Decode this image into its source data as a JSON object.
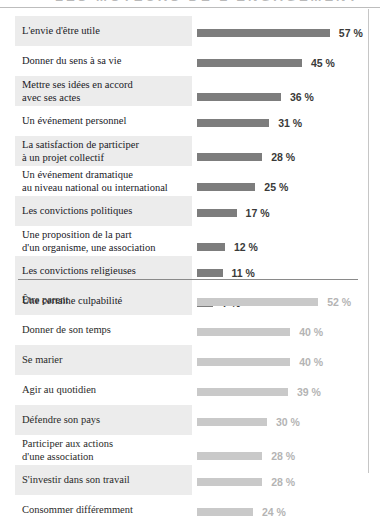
{
  "top_strip": {
    "clipped_title_remnant": "LES MOTEURS DE L'ENGAGEMENT"
  },
  "units": {
    "percent_suffix": "%"
  },
  "colors": {
    "bar_section_1": "#7d7d7d",
    "bar_section_2": "#c9c9c9",
    "row_band": "#ececec",
    "value_section_1": "#3a3a39",
    "value_section_2": "#b4b4b4",
    "label_text": "#20201f",
    "rule": "#8a8a8a"
  },
  "chart_data": [
    {
      "type": "bar",
      "title": "",
      "xlabel": "",
      "ylabel": "",
      "orientation": "horizontal",
      "grid": false,
      "legend": "none",
      "xlim": [
        0,
        60
      ],
      "categories": [
        "L'envie d'être utile",
        "Donner du sens à sa vie",
        "Mettre ses idées en accord\navec ses actes",
        "Un événement personnel",
        "La satisfaction de participer\nà un projet collectif",
        "Un événement dramatique\nau niveau national ou international",
        "Les convictions politiques",
        "Une proposition de la part\nd'un organisme, une association",
        "Les convictions religieuses",
        "Une certaine culpabilité"
      ],
      "values": [
        57,
        45,
        36,
        31,
        28,
        25,
        17,
        12,
        11,
        7
      ],
      "value_labels": [
        "57 %",
        "45 %",
        "36 %",
        "31 %",
        "28 %",
        "25 %",
        "17 %",
        "12 %",
        "11 %",
        "7 %"
      ]
    },
    {
      "type": "bar",
      "title": "",
      "xlabel": "",
      "ylabel": "",
      "orientation": "horizontal",
      "grid": false,
      "legend": "none",
      "xlim": [
        0,
        60
      ],
      "categories": [
        "Être parent",
        "Donner de son temps",
        "Se marier",
        "Agir au quotidien",
        "Défendre son pays",
        "Participer aux actions\nd'une association",
        "S'investir dans son travail",
        "Consommer différemment"
      ],
      "values": [
        52,
        40,
        40,
        39,
        30,
        28,
        28,
        24
      ],
      "value_labels": [
        "52 %",
        "40 %",
        "40 %",
        "39 %",
        "30 %",
        "28 %",
        "28 %",
        "24 %"
      ]
    }
  ],
  "section_1": {
    "rows": [
      {
        "label_line1": "L'envie d'être utile",
        "label_line2": "",
        "value": "57 %",
        "pct": 57,
        "shaded": true
      },
      {
        "label_line1": "Donner du sens à sa vie",
        "label_line2": "",
        "value": "45 %",
        "pct": 45,
        "shaded": false
      },
      {
        "label_line1": "Mettre ses idées en accord",
        "label_line2": "avec ses actes",
        "value": "36 %",
        "pct": 36,
        "shaded": true
      },
      {
        "label_line1": "Un événement personnel",
        "label_line2": "",
        "value": "31 %",
        "pct": 31,
        "shaded": false
      },
      {
        "label_line1": "La satisfaction de participer",
        "label_line2": "à un projet collectif",
        "value": "28 %",
        "pct": 28,
        "shaded": true
      },
      {
        "label_line1": "Un événement dramatique",
        "label_line2": "au niveau national ou international",
        "value": "25 %",
        "pct": 25,
        "shaded": false
      },
      {
        "label_line1": "Les convictions politiques",
        "label_line2": "",
        "value": "17 %",
        "pct": 17,
        "shaded": true
      },
      {
        "label_line1": "Une proposition de la part",
        "label_line2": "d'un organisme, une association",
        "value": "12 %",
        "pct": 12,
        "shaded": false
      },
      {
        "label_line1": "Les convictions religieuses",
        "label_line2": "",
        "value": "11 %",
        "pct": 11,
        "shaded": true
      },
      {
        "label_line1": "Une certaine culpabilité",
        "label_line2": "",
        "value": "7 %",
        "pct": 7,
        "shaded": false
      }
    ]
  },
  "section_2": {
    "rows": [
      {
        "label_line1": "Être parent",
        "label_line2": "",
        "value": "52 %",
        "pct": 52,
        "shaded": true
      },
      {
        "label_line1": "Donner de son temps",
        "label_line2": "",
        "value": "40 %",
        "pct": 40,
        "shaded": false
      },
      {
        "label_line1": "Se marier",
        "label_line2": "",
        "value": "40 %",
        "pct": 40,
        "shaded": true
      },
      {
        "label_line1": "Agir au quotidien",
        "label_line2": "",
        "value": "39 %",
        "pct": 39,
        "shaded": false
      },
      {
        "label_line1": "Défendre son pays",
        "label_line2": "",
        "value": "30 %",
        "pct": 30,
        "shaded": true
      },
      {
        "label_line1": "Participer aux actions",
        "label_line2": "d'une association",
        "value": "28 %",
        "pct": 28,
        "shaded": false
      },
      {
        "label_line1": "S'investir dans son travail",
        "label_line2": "",
        "value": "28 %",
        "pct": 28,
        "shaded": true
      },
      {
        "label_line1": "Consommer différemment",
        "label_line2": "",
        "value": "24 %",
        "pct": 24,
        "shaded": false
      }
    ]
  }
}
